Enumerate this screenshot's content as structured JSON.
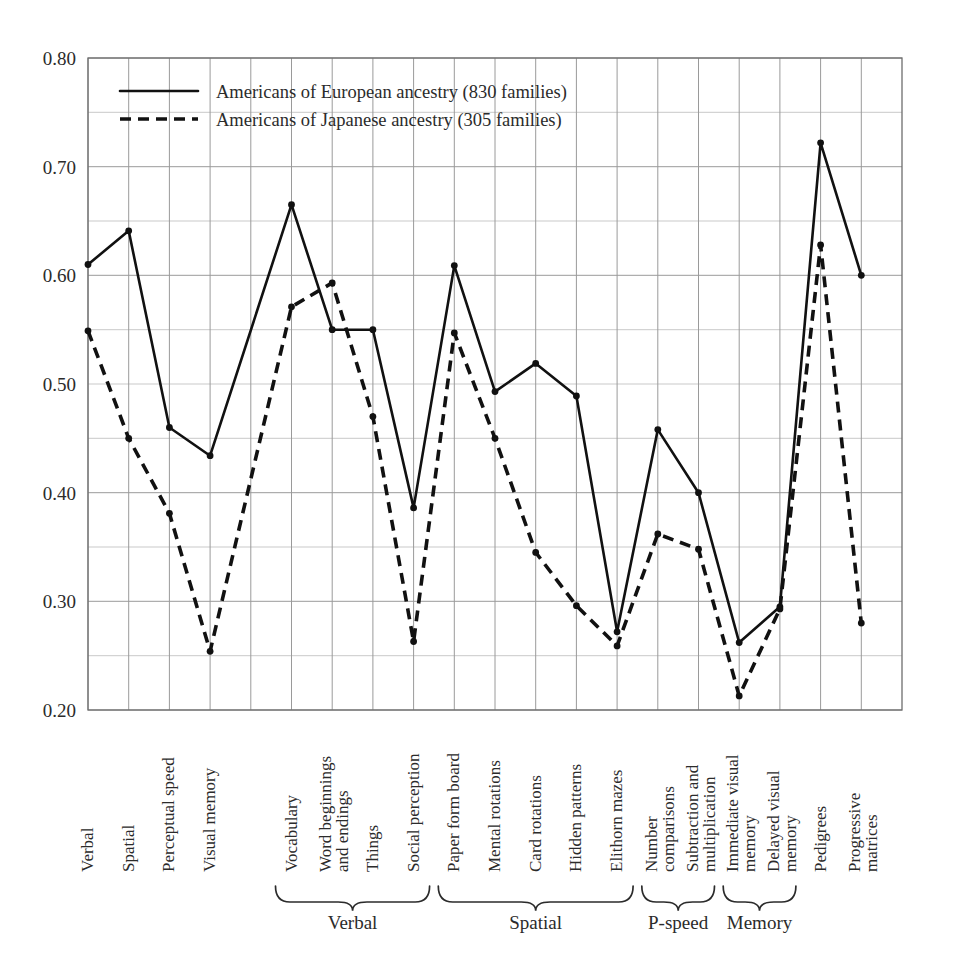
{
  "chart_data": {
    "type": "line",
    "title": "",
    "xlabel": "",
    "ylabel": "",
    "ylim": [
      0.2,
      0.8
    ],
    "ytick_labels": [
      "0.20",
      "0.30",
      "0.40",
      "0.50",
      "0.60",
      "0.70",
      "0.80"
    ],
    "ytick_values": [
      0.2,
      0.3,
      0.4,
      0.5,
      0.6,
      0.7,
      0.8
    ],
    "grid": "both, major every 0.05 horizontal, vertical at each category slot",
    "legend_position": "top-left inside plot",
    "categories": [
      "Verbal",
      "Spatial",
      "Perceptual speed",
      "Visual memory",
      "Vocabulary",
      "Word beginnings and endings",
      "Things",
      "Social perception",
      "Paper form board",
      "Mental rotations",
      "Card rotations",
      "Hidden patterns",
      "Elithorn mazes",
      "Number comparisons",
      "Subtraction and multiplication",
      "Immediate visual memory",
      "Delayed visual memory",
      "Pedigrees",
      "Progressive matrices"
    ],
    "series": [
      {
        "name": "Americans of European ancestry (830 families)",
        "style": "solid",
        "families": 830,
        "values": [
          0.61,
          0.641,
          0.46,
          0.434,
          0.665,
          0.55,
          0.55,
          0.386,
          0.609,
          0.493,
          0.519,
          0.489,
          0.272,
          0.458,
          0.4,
          0.262,
          0.295,
          0.722,
          0.6
        ]
      },
      {
        "name": "Americans of Japanese ancestry (305 families)",
        "style": "dashed",
        "families": 305,
        "values": [
          0.549,
          0.45,
          0.381,
          0.254,
          0.571,
          0.593,
          0.47,
          0.263,
          0.547,
          0.45,
          0.345,
          0.296,
          0.259,
          0.362,
          0.348,
          0.213,
          0.293,
          0.628,
          0.28
        ]
      }
    ],
    "groups": [
      {
        "label": "Verbal",
        "from": "Vocabulary",
        "to": "Social perception",
        "start_index": 4,
        "end_index": 7
      },
      {
        "label": "Spatial",
        "from": "Paper form board",
        "to": "Elithorn mazes",
        "start_index": 8,
        "end_index": 12
      },
      {
        "label": "P-speed",
        "from": "Number comparisons",
        "to": "Subtraction and multiplication",
        "start_index": 13,
        "end_index": 14
      },
      {
        "label": "Memory",
        "from": "Immediate visual memory",
        "to": "Delayed visual memory",
        "start_index": 15,
        "end_index": 16
      }
    ],
    "ungrouped_indices": [
      0,
      1,
      2,
      3,
      17,
      18
    ],
    "colors": {
      "series": "#111111",
      "grid": "#9a9a9a",
      "grid_faint": "#c9c9c9",
      "frame": "#6e6e6e",
      "text": "#2b2b2b"
    }
  },
  "legend": {
    "items": [
      {
        "label": "Americans of European ancestry (830 families)",
        "style": "solid"
      },
      {
        "label": "Americans of Japanese ancestry (305 families)",
        "style": "dashed"
      }
    ]
  }
}
